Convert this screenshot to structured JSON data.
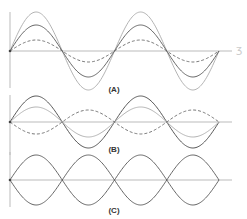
{
  "panels": [
    {
      "id": "A",
      "label": "(A)",
      "baseline_y": 51,
      "axis_top": 12,
      "axis_bottom": 88,
      "label_pos": [
        114,
        85
      ],
      "curves": [
        {
          "name": "wave-large",
          "amplitude": 39,
          "phase": 0,
          "style": "solid",
          "color": "#aaaaaa",
          "periods": 2
        },
        {
          "name": "wave-medium",
          "amplitude": 26,
          "phase": 0,
          "style": "solid",
          "color": "#555555",
          "periods": 2
        },
        {
          "name": "wave-small",
          "amplitude": 11,
          "phase": 0,
          "style": "dashed",
          "color": "#666666",
          "periods": 2
        }
      ]
    },
    {
      "id": "B",
      "label": "(B)",
      "baseline_y": 122,
      "axis_top": 95,
      "axis_bottom": 155,
      "label_pos": [
        114,
        145
      ],
      "curves": [
        {
          "name": "wave-dark",
          "amplitude": 26,
          "phase": 0,
          "style": "solid",
          "color": "#444444",
          "periods": 2
        },
        {
          "name": "wave-light",
          "amplitude": 15,
          "phase": 0,
          "style": "solid",
          "color": "#aaaaaa",
          "periods": 2
        },
        {
          "name": "wave-inverted-dashed",
          "amplitude": -12,
          "phase": 0,
          "style": "dashed",
          "color": "#666666",
          "periods": 2
        }
      ]
    },
    {
      "id": "C",
      "label": "(C)",
      "baseline_y": 180,
      "axis_top": 152,
      "axis_bottom": 207,
      "label_pos": [
        114,
        206
      ],
      "curves": [
        {
          "name": "wave-upper",
          "amplitude": 25,
          "phase": 0,
          "style": "solid",
          "color": "#555555",
          "periods": 2,
          "abs": true
        },
        {
          "name": "wave-lower",
          "amplitude": -25,
          "phase": 0,
          "style": "solid",
          "color": "#555555",
          "periods": 2,
          "abs": true
        }
      ]
    }
  ],
  "x_start": 10,
  "x_end": 219,
  "axis_extend": 232,
  "annotation_mark": "ʒ"
}
